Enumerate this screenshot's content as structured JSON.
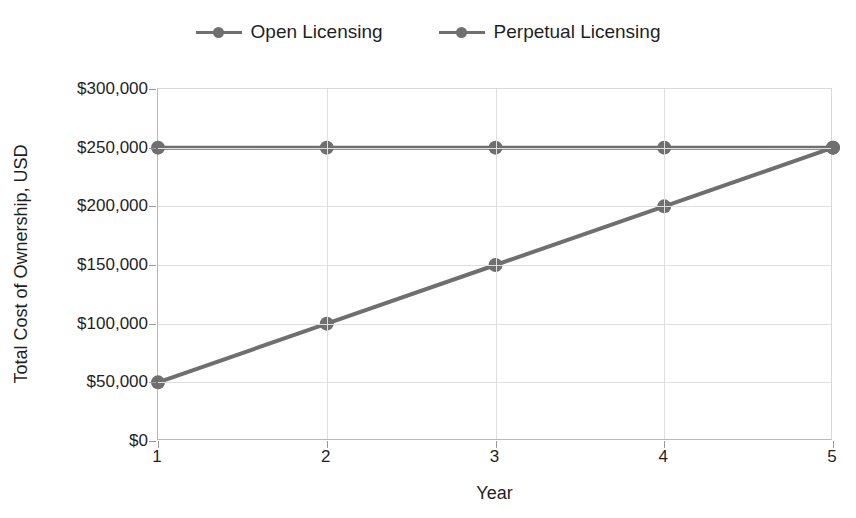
{
  "chart_data": {
    "type": "line",
    "title": "",
    "xlabel": "Year",
    "ylabel": "Total Cost of Ownership, USD",
    "x": [
      1,
      2,
      3,
      4,
      5
    ],
    "xticklabels": [
      "1",
      "2",
      "3",
      "4",
      "5"
    ],
    "yticks": [
      0,
      50000,
      100000,
      150000,
      200000,
      250000,
      300000
    ],
    "yticklabels": [
      "$0",
      "$50,000",
      "$100,000",
      "$150,000",
      "$200,000",
      "$250,000",
      "$300,000"
    ],
    "ylim": [
      0,
      300000
    ],
    "xlim": [
      1,
      5
    ],
    "grid": true,
    "legend_position": "top-center",
    "series": [
      {
        "name": "Open Licensing",
        "color": "#6f6f6f",
        "values": [
          50000,
          100000,
          150000,
          200000,
          250000
        ]
      },
      {
        "name": "Perpetual Licensing",
        "color": "#6f6f6f",
        "values": [
          250000,
          250000,
          250000,
          250000,
          250000
        ]
      }
    ]
  },
  "legend": {
    "items": [
      {
        "label": "Open Licensing"
      },
      {
        "label": "Perpetual Licensing"
      }
    ]
  },
  "axes": {
    "y_title": "Total Cost of Ownership, USD",
    "x_title": "Year"
  },
  "colors": {
    "series": "#6f6f6f",
    "grid": "#dedede",
    "axis": "#b8b8b8",
    "text": "#1f1f1f",
    "background": "#ffffff"
  }
}
